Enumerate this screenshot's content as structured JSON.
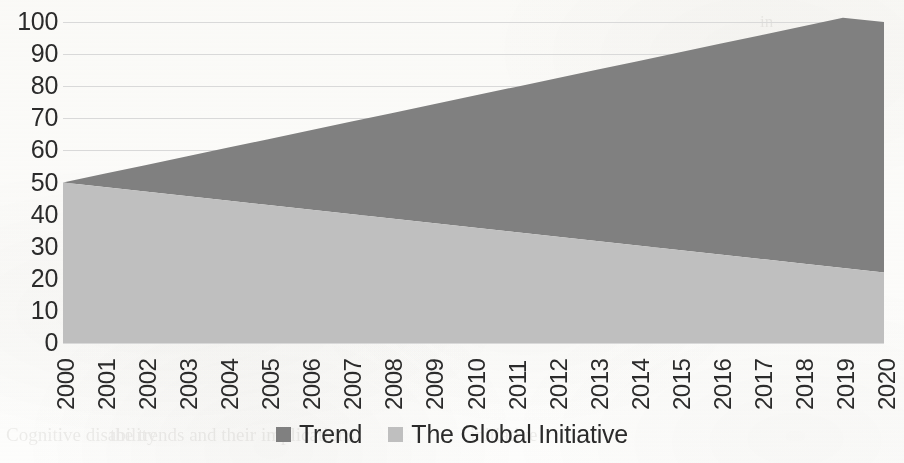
{
  "chart_data": {
    "type": "area",
    "stacked": true,
    "title": "",
    "subtitle": "",
    "xlabel": "",
    "ylabel": "",
    "grid": true,
    "legend_position": "bottom",
    "ylim": [
      0,
      100
    ],
    "yticks": [
      0,
      10,
      20,
      30,
      40,
      50,
      60,
      70,
      80,
      90,
      100
    ],
    "ytick_labels": [
      "0",
      "10",
      "20",
      "30",
      "40",
      "50",
      "60",
      "70",
      "80",
      "90",
      "100"
    ],
    "categories": [
      "2000",
      "2001",
      "2002",
      "2003",
      "2004",
      "2005",
      "2006",
      "2007",
      "2008",
      "2009",
      "2010",
      "2011",
      "2012",
      "2013",
      "2014",
      "2015",
      "2016",
      "2017",
      "2018",
      "2019",
      "2020"
    ],
    "xtick_rotation": -90,
    "series": [
      {
        "name": "Trend",
        "color": "#808080",
        "stack_order": 2,
        "values": [
          0,
          4.1,
          8.2,
          12.3,
          16.4,
          20.5,
          24.6,
          28.7,
          32.8,
          36.9,
          41.0,
          45.1,
          49.2,
          53.3,
          57.4,
          61.5,
          65.6,
          69.7,
          73.8,
          77.9,
          78.0
        ]
      },
      {
        "name": "The Global Initiative",
        "color": "#bfbfbf",
        "stack_order": 1,
        "values": [
          50,
          48.6,
          47.2,
          45.8,
          44.4,
          43.0,
          41.6,
          40.2,
          38.8,
          37.4,
          36.0,
          34.6,
          33.2,
          31.8,
          30.4,
          29.0,
          27.6,
          26.2,
          24.8,
          23.4,
          22.0
        ]
      }
    ],
    "stacked_totals": [
      50,
      52.5,
      55,
      57.5,
      60,
      62.5,
      65,
      67.5,
      70,
      72.5,
      75,
      77.5,
      80,
      82.5,
      85,
      87.5,
      90,
      92.5,
      95,
      97.5,
      100
    ]
  },
  "legend": {
    "items": [
      {
        "label": "Trend",
        "color": "#808080",
        "marker": "square-swatch-icon"
      },
      {
        "label": "The Global Initiative",
        "color": "#bfbfbf",
        "marker": "square-swatch-icon"
      }
    ]
  },
  "colors": {
    "trend": "#808080",
    "global_initiative": "#bfbfbf",
    "gridline": "#d9d9d9",
    "text": "#2b2b2b",
    "background": "#fdfdfc"
  },
  "background_artifacts": {
    "note": "faint scanned bleed-through text, illegible",
    "ghosts": [
      {
        "text": "Quarterly Trend and Analysis",
        "x": 210,
        "y": 272,
        "size": 19
      },
      {
        "text": "Forecasting",
        "x": 620,
        "y": 272,
        "size": 19
      },
      {
        "text": "Cognitive disability",
        "x": 6,
        "y": 424,
        "size": 19
      },
      {
        "text": "the trends and their implications",
        "x": 110,
        "y": 424,
        "size": 19
      },
      {
        "text": "initiative",
        "x": 470,
        "y": 424,
        "size": 19
      },
      {
        "text": "in",
        "x": 760,
        "y": 12,
        "size": 17
      }
    ]
  }
}
